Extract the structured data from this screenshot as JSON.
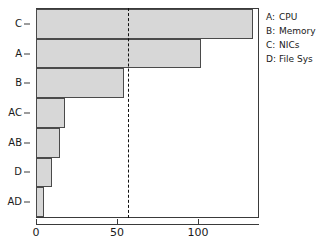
{
  "chart_data": {
    "type": "bar",
    "orientation": "horizontal",
    "title": "",
    "xlabel": "",
    "ylabel": "",
    "categories": [
      "C",
      "A",
      "B",
      "AC",
      "AB",
      "D",
      "AD"
    ],
    "values": [
      134,
      102,
      54,
      18,
      15,
      10,
      5
    ],
    "xlim": [
      0,
      137
    ],
    "ylim": [
      0,
      7
    ],
    "xticks": [
      0,
      50,
      100
    ],
    "xtick_labels": [
      "0",
      "50",
      "100"
    ],
    "grid": false,
    "annotations": [
      {
        "name": "threshold-line",
        "type": "vline",
        "value": 57,
        "style": "dashed",
        "color": "#111111"
      }
    ],
    "bar_fill_color": "#d7d7d7",
    "bar_edge_color": "#4a4a4a",
    "legend_position": "right"
  },
  "legend": {
    "entries": [
      {
        "key": "A:",
        "name": "CPU"
      },
      {
        "key": "B:",
        "name": "Memory"
      },
      {
        "key": "C:",
        "name": "NICs"
      },
      {
        "key": "D:",
        "name": "File Sys"
      }
    ]
  }
}
